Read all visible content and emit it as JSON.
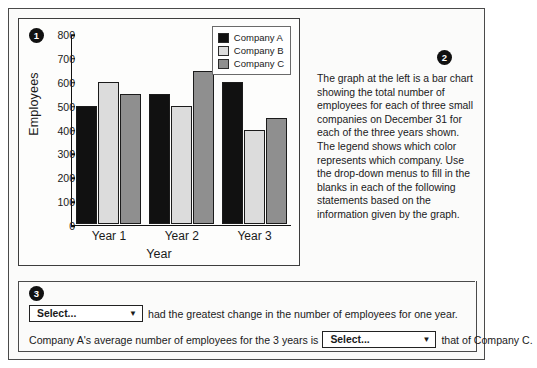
{
  "question": {
    "badges": {
      "one": "1",
      "two": "2",
      "three": "3"
    },
    "prose": "The graph at the left is a bar chart showing the total number of employees for each of three small companies on December 31 for each of the three years shown. The legend shows which color represents which company. Use the drop-down menus to fill in the blanks in each of the following statements based on the information given by the graph."
  },
  "statements": [
    {
      "dropdown_value": "Select...",
      "caret": "▼",
      "text_after": "had the greatest change in the number of employees for one year.",
      "text_before": ""
    },
    {
      "text_before": "Company A's average number of employees for the 3 years is",
      "dropdown_value": "Select...",
      "caret": "▼",
      "text_after": "that of Company C."
    }
  ],
  "chart_data": {
    "type": "bar",
    "title": "",
    "xlabel": "Year",
    "ylabel": "Employees",
    "categories": [
      "Year 1",
      "Year 2",
      "Year 3"
    ],
    "ylim": [
      0,
      800
    ],
    "yticks": [
      0,
      100,
      200,
      300,
      400,
      500,
      600,
      700,
      800
    ],
    "grid": false,
    "legend_position": "top-right",
    "series": [
      {
        "name": "Company A",
        "color": "#111111",
        "values": [
          500,
          550,
          600
        ]
      },
      {
        "name": "Company B",
        "color": "#dcdcdc",
        "values": [
          600,
          500,
          400
        ]
      },
      {
        "name": "Company C",
        "color": "#8f8f8f",
        "values": [
          550,
          650,
          450
        ]
      }
    ]
  }
}
